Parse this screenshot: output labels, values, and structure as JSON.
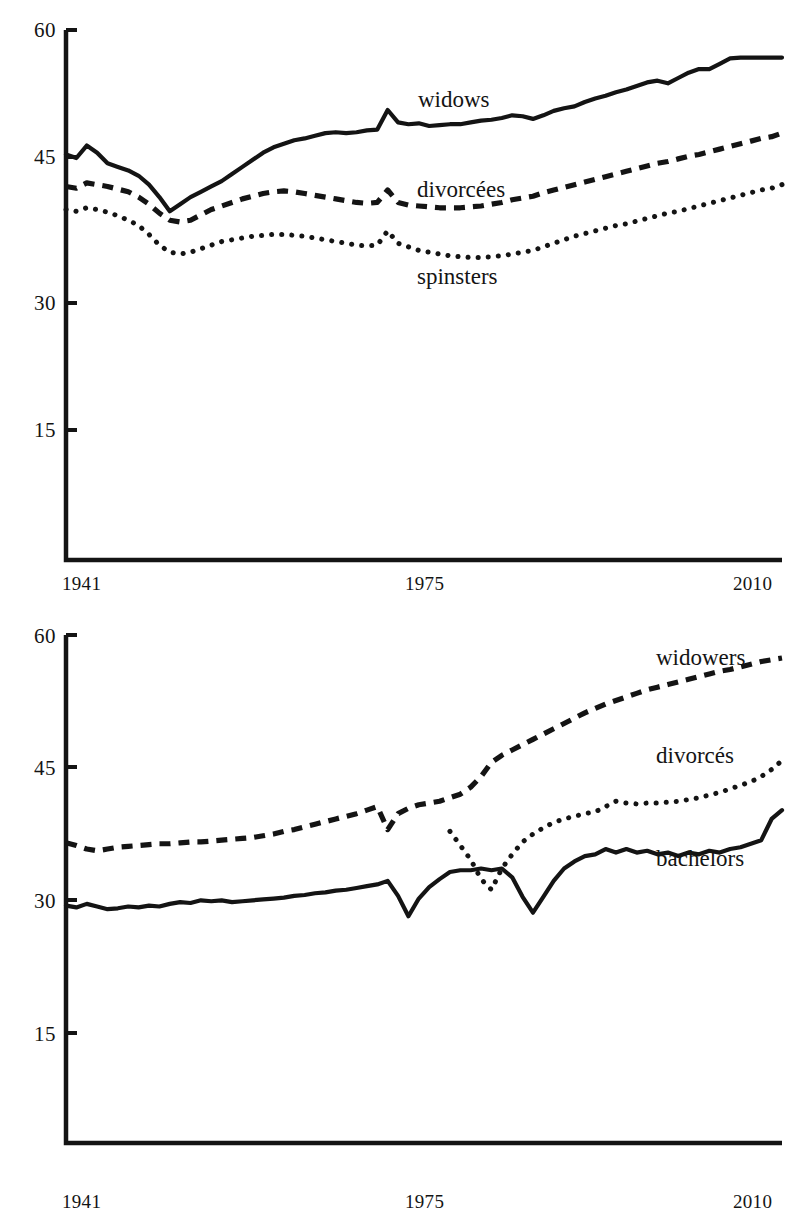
{
  "figure": {
    "background": "#ffffff",
    "ink": "#141414",
    "caption": ""
  },
  "chart_data": [
    {
      "id": "women",
      "type": "line",
      "title": "",
      "subtitle": "",
      "xlabel": "",
      "ylabel": "",
      "xlim": [
        1941,
        2010
      ],
      "ylim": [
        0,
        60
      ],
      "grid": false,
      "legend_position": "inline-annotations",
      "xticks": [
        1941,
        1975,
        2010
      ],
      "xticklabels": [
        "1941",
        "1975",
        "2010"
      ],
      "yticks": [
        15,
        30,
        45,
        60
      ],
      "yticklabels": [
        "15",
        "30",
        "45",
        "60"
      ],
      "annotations": [
        {
          "text": "widows",
          "x": 1978,
          "y": 51.5
        },
        {
          "text": "divorcées",
          "x": 1978,
          "y": 41.0
        },
        {
          "text": "spinsters",
          "x": 1978,
          "y": 32.0
        }
      ],
      "x": [
        1941,
        1942,
        1943,
        1944,
        1945,
        1946,
        1947,
        1948,
        1949,
        1950,
        1951,
        1952,
        1953,
        1954,
        1955,
        1956,
        1957,
        1958,
        1959,
        1960,
        1961,
        1962,
        1963,
        1964,
        1965,
        1966,
        1967,
        1968,
        1969,
        1970,
        1971,
        1972,
        1973,
        1974,
        1975,
        1976,
        1977,
        1978,
        1979,
        1980,
        1981,
        1982,
        1983,
        1984,
        1985,
        1986,
        1987,
        1988,
        1989,
        1990,
        1991,
        1992,
        1993,
        1994,
        1995,
        1996,
        1997,
        1998,
        1999,
        2000,
        2001,
        2002,
        2003,
        2004,
        2005,
        2006,
        2007,
        2008,
        2009,
        2010
      ],
      "series": [
        {
          "name": "widows",
          "style": "solid",
          "values": [
            46.0,
            45.6,
            47.0,
            46.2,
            45.0,
            44.6,
            44.2,
            43.6,
            42.6,
            41.2,
            39.6,
            40.4,
            41.2,
            41.8,
            42.4,
            43.0,
            43.8,
            44.6,
            45.4,
            46.2,
            46.8,
            47.2,
            47.6,
            47.8,
            48.1,
            48.4,
            48.5,
            48.4,
            48.5,
            48.7,
            48.8,
            51.0,
            49.6,
            49.4,
            49.5,
            49.2,
            49.3,
            49.4,
            49.4,
            49.6,
            49.8,
            49.9,
            50.1,
            50.4,
            50.3,
            50.0,
            50.4,
            50.9,
            51.2,
            51.4,
            51.9,
            52.3,
            52.6,
            53.0,
            53.3,
            53.7,
            54.1,
            54.3,
            54.0,
            54.6,
            55.2,
            55.6,
            55.6,
            56.2,
            56.8,
            56.9,
            56.9,
            56.9,
            56.9,
            56.9
          ]
        },
        {
          "name": "divorcées",
          "style": "dashed",
          "values": [
            42.4,
            42.2,
            42.8,
            42.6,
            42.4,
            42.1,
            41.8,
            41.2,
            40.4,
            39.4,
            38.6,
            38.4,
            38.6,
            39.2,
            39.8,
            40.2,
            40.6,
            41.0,
            41.3,
            41.6,
            41.8,
            41.9,
            41.8,
            41.6,
            41.4,
            41.2,
            41.0,
            40.8,
            40.6,
            40.5,
            40.6,
            42.0,
            40.6,
            40.3,
            40.2,
            40.1,
            40.0,
            40.0,
            40.0,
            40.1,
            40.2,
            40.4,
            40.6,
            40.9,
            41.1,
            41.3,
            41.7,
            42.0,
            42.3,
            42.6,
            42.9,
            43.2,
            43.5,
            43.8,
            44.1,
            44.4,
            44.7,
            45.0,
            45.2,
            45.5,
            45.8,
            46.0,
            46.3,
            46.6,
            46.9,
            47.2,
            47.5,
            47.8,
            48.0,
            48.4
          ]
        },
        {
          "name": "spinsters",
          "style": "dotted",
          "values": [
            39.8,
            39.6,
            40.0,
            39.8,
            39.5,
            39.1,
            38.6,
            38.0,
            37.0,
            35.8,
            35.0,
            34.8,
            35.0,
            35.4,
            35.8,
            36.2,
            36.4,
            36.6,
            36.8,
            36.9,
            37.0,
            37.0,
            36.9,
            36.8,
            36.6,
            36.4,
            36.2,
            36.0,
            35.8,
            35.7,
            35.8,
            37.4,
            36.0,
            35.6,
            35.2,
            35.0,
            34.8,
            34.6,
            34.5,
            34.4,
            34.4,
            34.5,
            34.6,
            34.8,
            35.0,
            35.2,
            35.6,
            36.0,
            36.4,
            36.8,
            37.1,
            37.4,
            37.7,
            38.0,
            38.2,
            38.5,
            38.8,
            39.1,
            39.4,
            39.6,
            39.9,
            40.2,
            40.5,
            40.8,
            41.1,
            41.4,
            41.7,
            42.0,
            42.2,
            42.6
          ]
        }
      ]
    },
    {
      "id": "men",
      "type": "line",
      "title": "",
      "subtitle": "",
      "xlabel": "",
      "ylabel": "",
      "xlim": [
        1941,
        2010
      ],
      "ylim": [
        0,
        60
      ],
      "grid": false,
      "legend_position": "inline-annotations",
      "xticks": [
        1941,
        1975,
        2010
      ],
      "xticklabels": [
        "1941",
        "1975",
        "2010"
      ],
      "yticks": [
        15,
        30,
        45,
        60
      ],
      "yticklabels": [
        "15",
        "30",
        "45",
        "60"
      ],
      "annotations": [
        {
          "text": "widowers",
          "x": 1993,
          "y": 56.0
        },
        {
          "text": "divorcés",
          "x": 1993,
          "y": 45.0
        },
        {
          "text": "bachelors",
          "x": 1993,
          "y": 33.5
        }
      ],
      "x": [
        1941,
        1942,
        1943,
        1944,
        1945,
        1946,
        1947,
        1948,
        1949,
        1950,
        1951,
        1952,
        1953,
        1954,
        1955,
        1956,
        1957,
        1958,
        1959,
        1960,
        1961,
        1962,
        1963,
        1964,
        1965,
        1966,
        1967,
        1968,
        1969,
        1970,
        1971,
        1972,
        1973,
        1974,
        1975,
        1976,
        1977,
        1978,
        1979,
        1980,
        1981,
        1982,
        1983,
        1984,
        1985,
        1986,
        1987,
        1988,
        1989,
        1990,
        1991,
        1992,
        1993,
        1994,
        1995,
        1996,
        1997,
        1998,
        1999,
        2000,
        2001,
        2002,
        2003,
        2004,
        2005,
        2006,
        2007,
        2008,
        2009,
        2010
      ],
      "series": [
        {
          "name": "widowers",
          "style": "dashed",
          "values": [
            36.5,
            36.2,
            35.8,
            35.6,
            35.8,
            36.0,
            36.1,
            36.2,
            36.3,
            36.4,
            36.4,
            36.5,
            36.6,
            36.6,
            36.7,
            36.8,
            36.9,
            37.0,
            37.1,
            37.3,
            37.5,
            37.8,
            38.0,
            38.3,
            38.6,
            38.9,
            39.2,
            39.5,
            39.8,
            40.2,
            40.6,
            38.0,
            39.8,
            40.4,
            40.8,
            41.0,
            41.2,
            41.6,
            42.0,
            42.8,
            44.0,
            45.6,
            46.4,
            47.0,
            47.6,
            48.2,
            48.8,
            49.4,
            50.0,
            50.6,
            51.2,
            51.7,
            52.2,
            52.6,
            53.0,
            53.4,
            53.8,
            54.1,
            54.4,
            54.7,
            55.0,
            55.3,
            55.6,
            55.9,
            56.1,
            56.4,
            56.7,
            57.0,
            57.2,
            57.4
          ]
        },
        {
          "name": "divorcés",
          "style": "dotted",
          "values": [
            null,
            null,
            null,
            null,
            null,
            null,
            null,
            null,
            null,
            null,
            null,
            null,
            null,
            null,
            null,
            null,
            null,
            null,
            null,
            null,
            null,
            null,
            null,
            null,
            null,
            null,
            null,
            null,
            null,
            null,
            null,
            null,
            null,
            null,
            null,
            null,
            null,
            37.8,
            36.2,
            34.6,
            32.4,
            31.2,
            33.6,
            35.2,
            36.6,
            37.5,
            38.2,
            38.8,
            39.2,
            39.5,
            39.8,
            40.0,
            40.6,
            41.2,
            41.0,
            40.9,
            41.0,
            41.0,
            41.1,
            41.2,
            41.4,
            41.6,
            41.9,
            42.2,
            42.6,
            43.0,
            43.4,
            44.0,
            44.8,
            45.8
          ]
        },
        {
          "name": "bachelors",
          "style": "solid",
          "values": [
            29.4,
            29.2,
            29.6,
            29.3,
            29.0,
            29.1,
            29.3,
            29.2,
            29.4,
            29.3,
            29.6,
            29.8,
            29.7,
            30.0,
            29.9,
            30.0,
            29.8,
            29.9,
            30.0,
            30.1,
            30.2,
            30.3,
            30.5,
            30.6,
            30.8,
            30.9,
            31.1,
            31.2,
            31.4,
            31.6,
            31.8,
            32.2,
            30.5,
            28.2,
            30.2,
            31.5,
            32.4,
            33.2,
            33.4,
            33.4,
            33.6,
            33.4,
            33.6,
            32.6,
            30.4,
            28.6,
            30.4,
            32.2,
            33.6,
            34.4,
            35.0,
            35.2,
            35.8,
            35.4,
            35.8,
            35.4,
            35.6,
            35.2,
            35.4,
            35.0,
            35.4,
            35.2,
            35.6,
            35.4,
            35.8,
            36.0,
            36.4,
            36.8,
            39.2,
            40.2
          ]
        }
      ]
    }
  ]
}
